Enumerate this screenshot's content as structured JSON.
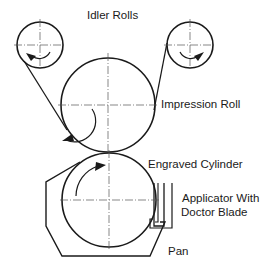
{
  "diagram": {
    "type": "gravure printing press schematic",
    "labels": {
      "idler_rolls": "Idler Rolls",
      "impression_roll": "Impression Roll",
      "engraved_cylinder": "Engraved Cylinder",
      "applicator_line1": "Applicator With",
      "applicator_line2": "Doctor Blade",
      "pan": "Pan"
    },
    "colors": {
      "line": "#1a1a1a",
      "background": "#ffffff"
    }
  }
}
